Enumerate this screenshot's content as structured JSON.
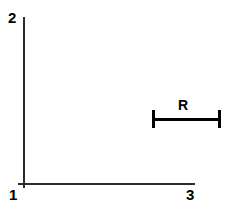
{
  "figure": {
    "title": "",
    "background_color": "#ffffff",
    "width": 227,
    "height": 212
  },
  "axes": {
    "line_color": "#2b2b2b",
    "vertical_axis_label": "2",
    "origin_label": "1",
    "horizontal_axis_label": "3"
  },
  "dimension": {
    "label": "R",
    "line_color": "#000000"
  },
  "chart_data": {
    "type": "diagram",
    "title": "",
    "xlabel": "",
    "ylabel": "",
    "grid": false,
    "legend": null,
    "annotations": [
      {
        "name": "corner-label-top-left",
        "text": "2",
        "x": 9,
        "y": 17
      },
      {
        "name": "corner-label-bottom-left",
        "text": "1",
        "x": 10,
        "y": 194
      },
      {
        "name": "corner-label-bottom-right",
        "text": "3",
        "x": 187,
        "y": 194
      },
      {
        "name": "dimension-label",
        "text": "R",
        "x": 184,
        "y": 105
      }
    ],
    "elements": [
      {
        "name": "vertical-axis",
        "type": "line",
        "x1": 24,
        "y1": 17,
        "x2": 24,
        "y2": 185
      },
      {
        "name": "horizontal-axis",
        "type": "line",
        "x1": 18,
        "y1": 184,
        "x2": 194,
        "y2": 184
      },
      {
        "name": "dimension-bar",
        "type": "line",
        "x1": 153,
        "y1": 119,
        "x2": 220,
        "y2": 119
      },
      {
        "name": "dimension-tick-left",
        "type": "line",
        "x1": 153,
        "y1": 111,
        "x2": 153,
        "y2": 127
      },
      {
        "name": "dimension-tick-right",
        "type": "line",
        "x1": 220,
        "y1": 111,
        "x2": 220,
        "y2": 127
      }
    ]
  }
}
